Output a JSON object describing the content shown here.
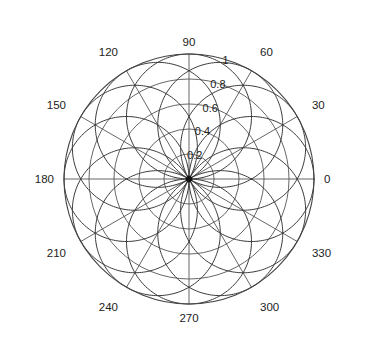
{
  "chart_data": {
    "type": "line",
    "title": "",
    "subtitle": "",
    "xlabel": "",
    "ylabel": "",
    "projection": "polar",
    "grid": true,
    "legend": null,
    "angle_unit": "degrees",
    "angle_direction": "counterclockwise",
    "angle_zero_location": "E",
    "rlim": [
      0,
      1
    ],
    "radial_ticks": [
      0.2,
      0.4,
      0.6,
      0.8,
      1
    ],
    "radial_tick_labels": [
      "0.2",
      "0.4",
      "0.6",
      "0.8",
      "1"
    ],
    "radial_label_angle_deg": 72,
    "angular_ticks": [
      0,
      30,
      60,
      90,
      120,
      150,
      180,
      210,
      240,
      270,
      300,
      330
    ],
    "angular_tick_labels": [
      "0",
      "30",
      "60",
      "90",
      "120",
      "150",
      "180",
      "210",
      "240",
      "270",
      "300",
      "330"
    ],
    "series": [
      {
        "name": "lobe-0",
        "formula": "r = |cos(theta - 0)|",
        "orientation_deg": 0,
        "peak": 1.0
      },
      {
        "name": "lobe-30",
        "formula": "r = |cos(theta - 30)|",
        "orientation_deg": 30,
        "peak": 1.0
      },
      {
        "name": "lobe-60",
        "formula": "r = |cos(theta - 60)|",
        "orientation_deg": 60,
        "peak": 1.0
      },
      {
        "name": "lobe-90",
        "formula": "r = |cos(theta - 90)|",
        "orientation_deg": 90,
        "peak": 1.0
      },
      {
        "name": "lobe-120",
        "formula": "r = |cos(theta - 120)|",
        "orientation_deg": 120,
        "peak": 1.0
      },
      {
        "name": "lobe-150",
        "formula": "r = |cos(theta - 150)|",
        "orientation_deg": 150,
        "peak": 1.0
      }
    ]
  },
  "geometry": {
    "center_x": 189,
    "center_y": 179,
    "radius_px": 125
  },
  "style": {
    "grid_color": "#555555",
    "curve_color": "#3a3a3a",
    "outer_color": "#444444",
    "text_color": "#222222",
    "background": "#ffffff"
  },
  "labels": {
    "angles": [
      {
        "value": "0",
        "deg": 0
      },
      {
        "value": "30",
        "deg": 30
      },
      {
        "value": "60",
        "deg": 60
      },
      {
        "value": "90",
        "deg": 90
      },
      {
        "value": "120",
        "deg": 120
      },
      {
        "value": "150",
        "deg": 150
      },
      {
        "value": "180",
        "deg": 180
      },
      {
        "value": "210",
        "deg": 210
      },
      {
        "value": "240",
        "deg": 240
      },
      {
        "value": "270",
        "deg": 270
      },
      {
        "value": "300",
        "deg": 300
      },
      {
        "value": "330",
        "deg": 330
      }
    ],
    "radii": [
      {
        "value": "0.2",
        "r": 0.2
      },
      {
        "value": "0.4",
        "r": 0.4
      },
      {
        "value": "0.6",
        "r": 0.6
      },
      {
        "value": "0.8",
        "r": 0.8
      },
      {
        "value": "1",
        "r": 1.0
      }
    ]
  }
}
